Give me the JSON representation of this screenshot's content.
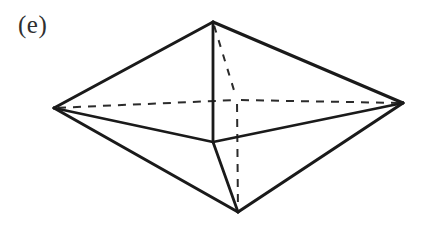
{
  "figure": {
    "label": "(e)",
    "caption_position": "top-left",
    "background_color": "#ffffff",
    "solid_edge_color": "#1a1a1a",
    "dashed_edge_color": "#2b2b2b",
    "width": 433,
    "height": 252
  },
  "chart_data": {
    "type": "diagram",
    "subtype": "line-drawing-polyhedron",
    "title": "(e)",
    "grid": false,
    "legend": null,
    "xlabel": "",
    "ylabel": "",
    "xlim": [
      0,
      433
    ],
    "ylim": [
      0,
      252
    ],
    "vertices": [
      {
        "id": "top-apex",
        "label": "top apex",
        "x": 213,
        "y": 22,
        "hidden": false
      },
      {
        "id": "left",
        "label": "left equatorial",
        "x": 54,
        "y": 108,
        "hidden": false
      },
      {
        "id": "right",
        "label": "right equatorial",
        "x": 403,
        "y": 103,
        "hidden": false
      },
      {
        "id": "front",
        "label": "front equatorial",
        "x": 213,
        "y": 142,
        "hidden": false
      },
      {
        "id": "back",
        "label": "back equatorial",
        "x": 237,
        "y": 100,
        "hidden": true
      },
      {
        "id": "bottom-apex",
        "label": "bottom apex",
        "x": 238,
        "y": 212,
        "hidden": false
      }
    ],
    "edges": [
      {
        "id": "e1",
        "from": "left",
        "to": "top-apex",
        "style": "solid",
        "name": "upper-left-silhouette"
      },
      {
        "id": "e2",
        "from": "top-apex",
        "to": "right",
        "style": "solid",
        "name": "upper-right-silhouette"
      },
      {
        "id": "e3",
        "from": "left",
        "to": "bottom-apex",
        "style": "solid",
        "name": "lower-left-silhouette"
      },
      {
        "id": "e4",
        "from": "bottom-apex",
        "to": "right",
        "style": "solid",
        "name": "lower-right-silhouette"
      },
      {
        "id": "e5",
        "from": "top-apex",
        "to": "front",
        "style": "solid",
        "name": "top-apex-to-front-vertical"
      },
      {
        "id": "e6",
        "from": "front",
        "to": "left",
        "style": "solid",
        "name": "front-to-left"
      },
      {
        "id": "e7",
        "from": "front",
        "to": "right",
        "style": "solid",
        "name": "front-to-right"
      },
      {
        "id": "e8",
        "from": "front",
        "to": "bottom-apex",
        "style": "solid",
        "name": "front-to-bottom-apex"
      },
      {
        "id": "e9",
        "from": "left",
        "to": "back",
        "style": "dashed",
        "name": "left-to-back-hidden"
      },
      {
        "id": "e10",
        "from": "back",
        "to": "right",
        "style": "dashed",
        "name": "back-to-right-hidden"
      },
      {
        "id": "e11",
        "from": "top-apex",
        "to": "back",
        "style": "dashed",
        "name": "top-apex-to-back-hidden"
      },
      {
        "id": "e12",
        "from": "back",
        "to": "bottom-apex",
        "style": "dashed",
        "name": "back-to-bottom-apex-hidden"
      }
    ],
    "vertex_count": 6,
    "edge_count": 12,
    "face_count": 6
  }
}
